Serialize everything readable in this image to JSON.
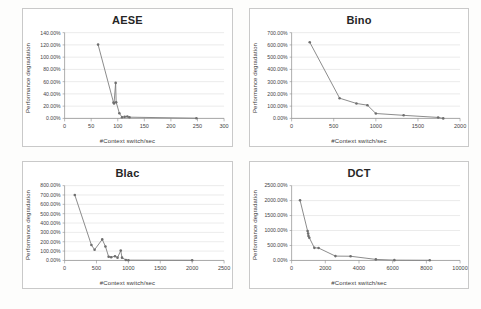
{
  "page": {
    "background_color": "#fdfdfc",
    "panel_border_color": "#c9c9c9",
    "series_color": "#7d7d7d",
    "gridline_color": "#d6d6d6"
  },
  "chart_data": [
    {
      "id": "aese",
      "type": "scatter",
      "title": "AESE",
      "xlabel": "#Context switch/sec",
      "ylabel": "Performance degradation",
      "xlim": [
        0,
        300
      ],
      "ylim": [
        0,
        140
      ],
      "xticks": [
        0,
        50,
        100,
        150,
        200,
        250,
        300
      ],
      "xtick_labels": [
        "0",
        "50",
        "100",
        "150",
        "200",
        "250",
        "300"
      ],
      "yticks": [
        0,
        20,
        40,
        60,
        80,
        100,
        120,
        140
      ],
      "ytick_labels": [
        "0.00%",
        "20.00%",
        "40.00%",
        "60.00%",
        "80.00%",
        "100.00%",
        "120.00%",
        "140.00%"
      ],
      "grid": true,
      "legend": "none",
      "x": [
        63,
        92,
        93,
        96,
        97,
        103,
        108,
        113,
        118,
        122,
        248
      ],
      "y": [
        120.5,
        26.0,
        24.5,
        58.0,
        26.5,
        8.5,
        2.0,
        2.5,
        3.0,
        2.0,
        0.3
      ]
    },
    {
      "id": "bino",
      "type": "scatter",
      "title": "Bino",
      "xlabel": "#Context switch/sec",
      "ylabel": "Performance degradation",
      "xlim": [
        0,
        2000
      ],
      "ylim": [
        0,
        700
      ],
      "xticks": [
        0,
        500,
        1000,
        1500,
        2000
      ],
      "xtick_labels": [
        "0",
        "500",
        "1000",
        "1500",
        "2000"
      ],
      "yticks": [
        0,
        100,
        200,
        300,
        400,
        500,
        600,
        700
      ],
      "ytick_labels": [
        "0.00%",
        "100.00%",
        "200.00%",
        "300.00%",
        "400.00%",
        "500.00%",
        "600.00%",
        "700.00%"
      ],
      "grid": true,
      "legend": "none",
      "x": [
        215,
        570,
        770,
        900,
        1000,
        1330,
        1740,
        1800
      ],
      "y": [
        622,
        165,
        122,
        108,
        40,
        25,
        8,
        0
      ]
    },
    {
      "id": "blac",
      "type": "scatter",
      "title": "Blac",
      "xlabel": "#Context switch/sec",
      "ylabel": "Performance degradation",
      "xlim": [
        0,
        2500
      ],
      "ylim": [
        0,
        800
      ],
      "xticks": [
        0,
        500,
        1000,
        1500,
        2000,
        2500
      ],
      "xtick_labels": [
        "0",
        "500",
        "1000",
        "1500",
        "2000",
        "2500"
      ],
      "yticks": [
        0,
        100,
        200,
        300,
        400,
        500,
        600,
        700,
        800
      ],
      "ytick_labels": [
        "0.00%",
        "100.00%",
        "200.00%",
        "300.00%",
        "400.00%",
        "500.00%",
        "600.00%",
        "700.00%",
        "800.00%"
      ],
      "grid": true,
      "legend": "none",
      "x": [
        160,
        420,
        470,
        590,
        640,
        690,
        730,
        790,
        830,
        880,
        900,
        960,
        1000,
        2000
      ],
      "y": [
        700,
        165,
        115,
        225,
        150,
        40,
        35,
        45,
        30,
        105,
        30,
        5,
        3,
        2
      ]
    },
    {
      "id": "dct",
      "type": "scatter",
      "title": "DCT",
      "xlabel": "#Context switch/sec",
      "ylabel": "Performance degradation",
      "xlim": [
        0,
        10000
      ],
      "ylim": [
        0,
        2500
      ],
      "xticks": [
        0,
        2000,
        4000,
        6000,
        8000,
        10000
      ],
      "xtick_labels": [
        "0",
        "2000",
        "4000",
        "6000",
        "8000",
        "10000"
      ],
      "yticks": [
        0,
        500,
        1000,
        1500,
        2000,
        2500
      ],
      "ytick_labels": [
        "0.00%",
        "500.00%",
        "1000.00%",
        "1500.00%",
        "2000.00%",
        "2500.00%"
      ],
      "grid": true,
      "legend": "none",
      "x": [
        500,
        950,
        980,
        1000,
        1050,
        1350,
        1600,
        2600,
        3500,
        5000,
        6100,
        8200
      ],
      "y": [
        2010,
        980,
        900,
        820,
        760,
        420,
        415,
        145,
        140,
        35,
        10,
        5
      ]
    }
  ]
}
